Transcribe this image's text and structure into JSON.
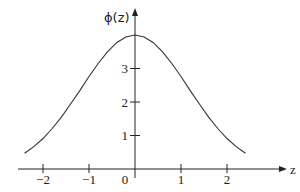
{
  "chart_data": {
    "type": "line",
    "title": "",
    "xlabel": "z",
    "ylabel": "ϕ(z)",
    "xlim": [
      -2.5,
      3.2
    ],
    "ylim": [
      0,
      4.8
    ],
    "grid": false,
    "legend": null,
    "x_ticks": [
      {
        "value": -2,
        "label": "−2"
      },
      {
        "value": -1,
        "label": "−1"
      },
      {
        "value": 0,
        "label": "0"
      },
      {
        "value": 1,
        "label": "1"
      },
      {
        "value": 2,
        "label": "2"
      }
    ],
    "y_ticks": [
      {
        "value": 1,
        "label": "1"
      },
      {
        "value": 2,
        "label": "2"
      },
      {
        "value": 3,
        "label": "3"
      }
    ],
    "series": [
      {
        "name": "ϕ(z)",
        "x": [
          -2.4,
          -2.2,
          -2.0,
          -1.8,
          -1.6,
          -1.4,
          -1.2,
          -1.0,
          -0.8,
          -0.6,
          -0.4,
          -0.2,
          0.0,
          0.2,
          0.4,
          0.6,
          0.8,
          1.0,
          1.2,
          1.4,
          1.6,
          1.8,
          2.0,
          2.2,
          2.4
        ],
        "values": [
          0.47,
          0.67,
          0.91,
          1.21,
          1.55,
          1.94,
          2.34,
          2.76,
          3.15,
          3.5,
          3.77,
          3.94,
          4.0,
          3.94,
          3.77,
          3.5,
          3.15,
          2.76,
          2.34,
          1.94,
          1.55,
          1.21,
          0.91,
          0.67,
          0.47
        ]
      }
    ]
  },
  "labels": {
    "x_axis": "z",
    "y_axis": "ϕ(z)",
    "origin": "0"
  },
  "colors": {
    "curve": "#333333",
    "axes": "#222222"
  }
}
